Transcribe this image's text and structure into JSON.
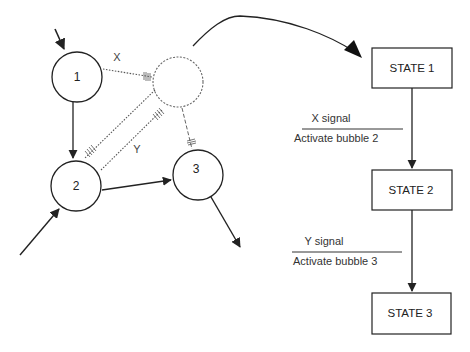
{
  "diagram": {
    "left_network": {
      "nodes": [
        {
          "id": "1",
          "label": "1",
          "style": "solid"
        },
        {
          "id": "hidden",
          "label": "",
          "style": "dashed"
        },
        {
          "id": "2",
          "label": "2",
          "style": "solid"
        },
        {
          "id": "3",
          "label": "3",
          "style": "solid"
        }
      ],
      "edges": [
        {
          "from": "external",
          "to": "1",
          "style": "solid",
          "label": ""
        },
        {
          "from": "1",
          "to": "2",
          "style": "solid",
          "label": ""
        },
        {
          "from": "1",
          "to": "hidden",
          "style": "dashed-inhibitory",
          "label": "X"
        },
        {
          "from": "hidden",
          "to": "2",
          "style": "dashed-inhibitory",
          "label": ""
        },
        {
          "from": "2",
          "to": "hidden",
          "style": "dashed-inhibitory",
          "label": "Y"
        },
        {
          "from": "hidden",
          "to": "3",
          "style": "dashed-inhibitory",
          "label": ""
        },
        {
          "from": "2",
          "to": "3",
          "style": "solid",
          "label": ""
        },
        {
          "from": "external",
          "to": "2",
          "style": "solid",
          "label": ""
        },
        {
          "from": "3",
          "to": "external",
          "style": "solid",
          "label": ""
        }
      ],
      "edge_labels": {
        "x": "X",
        "y": "Y"
      }
    },
    "state_machine": {
      "states": [
        "STATE 1",
        "STATE 2",
        "STATE 3"
      ],
      "transitions": [
        {
          "from": "STATE 1",
          "to": "STATE 2",
          "condition": "X signal",
          "action": "Activate bubble 2"
        },
        {
          "from": "STATE 2",
          "to": "STATE 3",
          "condition": "Y signal",
          "action": "Activate bubble 3"
        }
      ]
    },
    "colors": {
      "stroke": "#222222",
      "dashed": "#555555",
      "background": "#ffffff"
    }
  }
}
